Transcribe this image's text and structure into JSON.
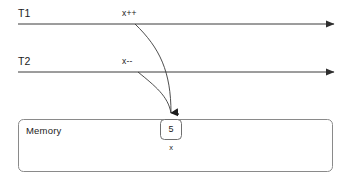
{
  "diagram": {
    "background_color": "#ffffff",
    "line_color": "#3a3a3a",
    "box_border_color": "#8a8a8a",
    "text_color": "#1b1b1b"
  },
  "threads": [
    {
      "id": "t1",
      "name": "T1",
      "operation": "x++",
      "timeline_y": 24,
      "timeline_x_start": 18,
      "timeline_x_end": 337
    },
    {
      "id": "t2",
      "name": "T2",
      "operation": "x--",
      "timeline_y": 72,
      "timeline_x_start": 18,
      "timeline_x_end": 337
    }
  ],
  "memory": {
    "title": "Memory",
    "cell": {
      "value": "5",
      "name": "x"
    }
  },
  "icons": {
    "arrowhead": "arrowhead-right",
    "arrowhead_down": "arrowhead-down"
  }
}
